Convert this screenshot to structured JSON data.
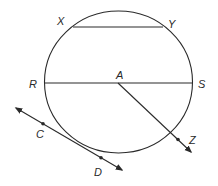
{
  "diagram": {
    "type": "geometry-circle",
    "circle": {
      "cx": 118.5,
      "cy": 82,
      "rx": 74,
      "ry": 71,
      "center_label": "A"
    },
    "chords": [
      {
        "name": "chord-xy",
        "from": "X",
        "to": "Y",
        "x1": 73,
        "y1": 27,
        "x2": 163,
        "y2": 27
      },
      {
        "name": "diameter-rs",
        "from": "R",
        "to": "S",
        "x1": 45,
        "y1": 83,
        "x2": 192,
        "y2": 83
      }
    ],
    "rays": [
      {
        "name": "ray-az",
        "from": "A",
        "through": "Z",
        "x1": 118,
        "y1": 83,
        "x2": 191,
        "y2": 152,
        "point": {
          "label": "Z",
          "x": 178,
          "y": 139
        }
      }
    ],
    "tangent_line": {
      "name": "line-cd",
      "x1": 16,
      "y1": 108,
      "x2": 122,
      "y2": 170,
      "points": [
        {
          "label": "C",
          "x": 43,
          "y": 123
        },
        {
          "label": "D",
          "x": 101,
          "y": 157
        }
      ]
    },
    "labels": {
      "X": {
        "text": "X",
        "x": 57,
        "y": 25
      },
      "Y": {
        "text": "Y",
        "x": 168,
        "y": 28
      },
      "R": {
        "text": "R",
        "x": 29,
        "y": 88
      },
      "A": {
        "text": "A",
        "x": 116,
        "y": 79
      },
      "S": {
        "text": "S",
        "x": 198,
        "y": 88
      },
      "C": {
        "text": "C",
        "x": 36,
        "y": 138
      },
      "D": {
        "text": "D",
        "x": 94,
        "y": 176
      },
      "Z": {
        "text": "Z",
        "x": 189,
        "y": 144
      }
    },
    "stroke_color": "#2a2a2a"
  }
}
